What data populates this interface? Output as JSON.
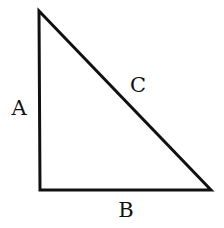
{
  "diagram": {
    "type": "right-triangle",
    "stroke_color": "#111111",
    "background_color": "#ffffff",
    "vertices": {
      "top": [
        39,
        11
      ],
      "right_angle": [
        40,
        190
      ],
      "bottom_right": [
        211,
        190
      ]
    },
    "sides": {
      "vertical": {
        "label": "A"
      },
      "horizontal": {
        "label": "B"
      },
      "hypotenuse": {
        "label": "C"
      }
    }
  }
}
